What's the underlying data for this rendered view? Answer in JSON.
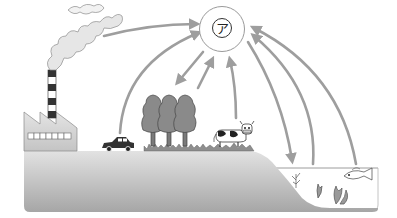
{
  "diagram": {
    "type": "carbon-cycle-illustration",
    "central_label": "ア",
    "elements": [
      {
        "name": "factory",
        "description": "factory with striped smokestack emitting smoke"
      },
      {
        "name": "car"
      },
      {
        "name": "trees",
        "count": 3
      },
      {
        "name": "cow"
      },
      {
        "name": "grass"
      },
      {
        "name": "land"
      },
      {
        "name": "water"
      },
      {
        "name": "aquatic-plants"
      },
      {
        "name": "fish"
      }
    ],
    "arrows": [
      {
        "from": "smoke",
        "to": "ア"
      },
      {
        "from": "car",
        "to": "ア"
      },
      {
        "from": "ア",
        "to": "trees"
      },
      {
        "from": "trees",
        "to": "ア"
      },
      {
        "from": "cow",
        "to": "ア"
      },
      {
        "from": "ア",
        "to": "water"
      },
      {
        "from": "aquatic-plants",
        "to": "ア"
      },
      {
        "from": "fish",
        "to": "ア"
      }
    ],
    "colors": {
      "arrow": "#9e9e9e",
      "land_top": "#d8d8d8",
      "land_bottom": "#a8a8a8",
      "tree": "#8a8a8a",
      "factory": "#d4d4d4"
    }
  }
}
